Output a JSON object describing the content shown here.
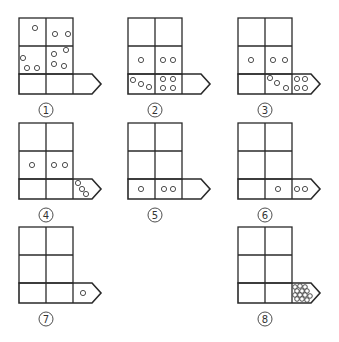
{
  "figure": {
    "colors": {
      "stroke": "#2a2a2a",
      "background": "#ffffff"
    },
    "panels": [
      {
        "label": "1",
        "origin": [
          19,
          18
        ],
        "balls": {
          "top_left": [
            [
              16,
              10
            ]
          ],
          "top_right": [
            [
              9,
              16
            ],
            [
              22,
              16
            ]
          ],
          "mid_left": [
            [
              4,
              12
            ],
            [
              8,
              22
            ],
            [
              18,
              22
            ]
          ],
          "mid_right": [
            [
              8,
              8
            ],
            [
              20,
              4
            ],
            [
              8,
              18
            ],
            [
              18,
              20
            ]
          ],
          "band_1": [],
          "band_2": [],
          "band_3": []
        }
      },
      {
        "label": "2",
        "origin": [
          128,
          18
        ],
        "balls": {
          "top_left": [],
          "top_right": [],
          "mid_left": [
            [
              13,
              14
            ]
          ],
          "mid_right": [
            [
              8,
              14
            ],
            [
              18,
              14
            ]
          ],
          "band_1": [
            [
              5,
              6
            ],
            [
              13,
              10
            ],
            [
              21,
              13
            ]
          ],
          "band_2": [
            [
              8,
              5
            ],
            [
              18,
              5
            ],
            [
              8,
              14
            ],
            [
              18,
              14
            ]
          ],
          "band_3": []
        }
      },
      {
        "label": "3",
        "origin": [
          238,
          18
        ],
        "balls": {
          "top_left": [],
          "top_right": [],
          "mid_left": [
            [
              13,
              14
            ]
          ],
          "mid_right": [
            [
              8,
              14
            ],
            [
              20,
              14
            ]
          ],
          "band_1": [],
          "band_2": [
            [
              5,
              4
            ],
            [
              12,
              9
            ],
            [
              21,
              14
            ]
          ],
          "band_3": [
            [
              5,
              5
            ],
            [
              13,
              5
            ],
            [
              5,
              14
            ],
            [
              13,
              14
            ]
          ]
        }
      },
      {
        "label": "4",
        "origin": [
          19,
          123
        ],
        "balls": {
          "top_left": [],
          "top_right": [],
          "mid_left": [
            [
              13,
              14
            ]
          ],
          "mid_right": [
            [
              8,
              14
            ],
            [
              19,
              14
            ]
          ],
          "band_1": [],
          "band_2": [],
          "band_3": [
            [
              5,
              4
            ],
            [
              9,
              10
            ],
            [
              13,
              15
            ]
          ]
        }
      },
      {
        "label": "5",
        "origin": [
          128,
          123
        ],
        "balls": {
          "top_left": [],
          "top_right": [],
          "mid_left": [],
          "mid_right": [],
          "band_1": [
            [
              13,
              10
            ]
          ],
          "band_2": [
            [
              9,
              10
            ],
            [
              18,
              10
            ]
          ],
          "band_3": []
        }
      },
      {
        "label": "6",
        "origin": [
          238,
          123
        ],
        "balls": {
          "top_left": [],
          "top_right": [],
          "mid_left": [],
          "mid_right": [],
          "band_1": [],
          "band_2": [
            [
              13,
              10
            ]
          ],
          "band_3": [
            [
              5,
              10
            ],
            [
              13,
              10
            ]
          ]
        }
      },
      {
        "label": "7",
        "origin": [
          19,
          227
        ],
        "balls": {
          "top_left": [],
          "top_right": [],
          "mid_left": [],
          "mid_right": [],
          "band_1": [],
          "band_2": [],
          "band_3": [
            [
              10,
              10
            ]
          ]
        }
      },
      {
        "label": "8",
        "origin": [
          238,
          227
        ],
        "balls": {
          "top_left": [],
          "top_right": [],
          "mid_left": [],
          "mid_right": [],
          "band_1": [],
          "band_2": [],
          "band_3": [
            [
              3,
              4
            ],
            [
              8,
              3
            ],
            [
              13,
              4
            ],
            [
              5,
              8
            ],
            [
              10,
              8
            ],
            [
              15,
              8
            ],
            [
              3,
              12
            ],
            [
              8,
              12
            ],
            [
              13,
              12
            ],
            [
              5,
              16
            ],
            [
              10,
              16
            ],
            [
              15,
              17
            ],
            [
              18,
              13
            ]
          ]
        }
      }
    ]
  }
}
